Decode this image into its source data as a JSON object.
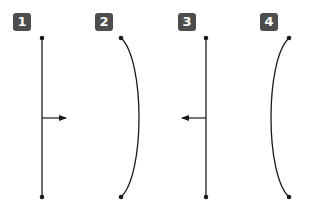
{
  "panels": [
    {
      "label": "1",
      "type": "straight-line",
      "arrow": "right"
    },
    {
      "label": "2",
      "type": "curve",
      "bulge": "right"
    },
    {
      "label": "3",
      "type": "straight-line",
      "arrow": "left"
    },
    {
      "label": "4",
      "type": "curve",
      "bulge": "left"
    }
  ],
  "colors": {
    "badge": "#4d4d4d",
    "badge_text": "#ffffff",
    "stroke": "#1a1a1a",
    "background": "#ffffff"
  }
}
